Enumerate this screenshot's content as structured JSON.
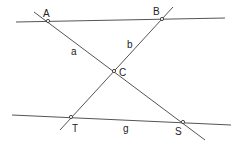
{
  "diagram": {
    "type": "geometry",
    "points": {
      "A": {
        "label": "A",
        "x": 48,
        "y": 21
      },
      "B": {
        "label": "B",
        "x": 162,
        "y": 19
      },
      "C": {
        "label": "C",
        "x": 114,
        "y": 71
      },
      "T": {
        "label": "T",
        "x": 71,
        "y": 117
      },
      "S": {
        "label": "S",
        "x": 183,
        "y": 122
      }
    },
    "lines": {
      "a": {
        "label": "a",
        "through": [
          "A",
          "C",
          "S"
        ]
      },
      "b": {
        "label": "b",
        "through": [
          "B",
          "C",
          "T"
        ]
      },
      "g": {
        "label": "g",
        "through": [
          "T",
          "S"
        ]
      },
      "top": {
        "label": "",
        "through": [
          "A",
          "B"
        ]
      }
    },
    "colors": {
      "line": "#555555",
      "text": "#222222",
      "background": "#ffffff"
    }
  }
}
